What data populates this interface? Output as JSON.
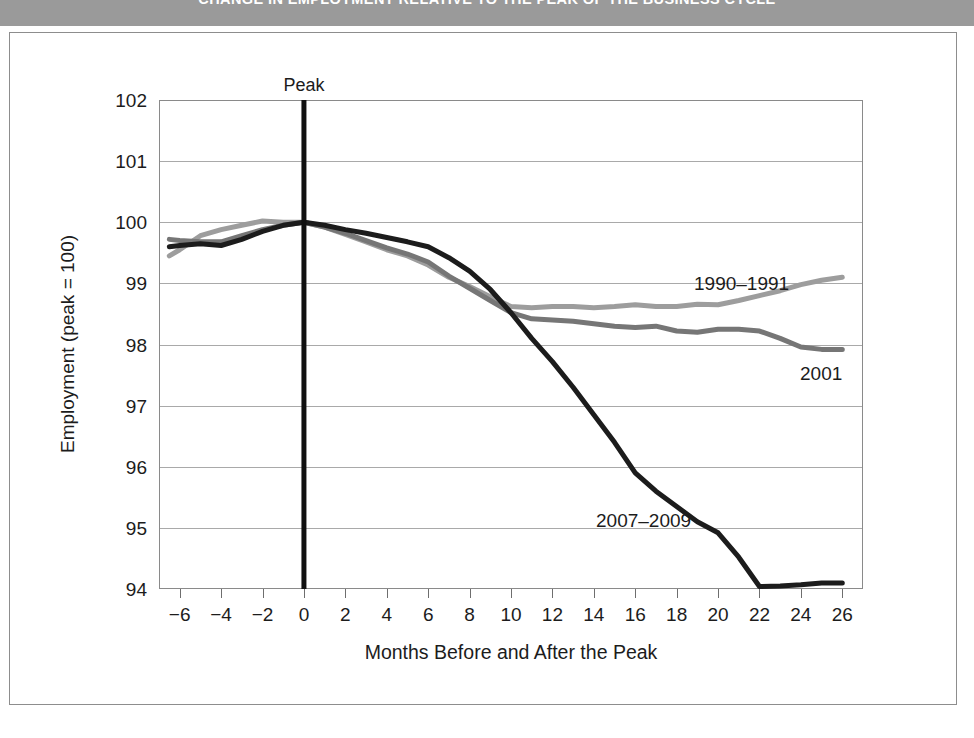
{
  "header": {
    "title": "CHANGE IN EMPLOYMENT RELATIVE TO THE PEAK OF THE BUSINESS CYCLE",
    "band_color": "#9a9a9a"
  },
  "annotations": {
    "peak_label": "Peak"
  },
  "chart_data": {
    "type": "line",
    "title": "",
    "xlabel": "Months Before and After the Peak",
    "ylabel": "Employment (peak = 100)",
    "xlim": [
      -7,
      27
    ],
    "ylim": [
      94,
      102
    ],
    "xticks": [
      "−6",
      "−4",
      "−2",
      "0",
      "2",
      "4",
      "6",
      "8",
      "10",
      "12",
      "14",
      "16",
      "18",
      "20",
      "22",
      "24",
      "26"
    ],
    "xtick_values": [
      -6,
      -4,
      -2,
      0,
      2,
      4,
      6,
      8,
      10,
      12,
      14,
      16,
      18,
      20,
      22,
      24,
      26
    ],
    "yticks": [
      "94",
      "95",
      "96",
      "97",
      "98",
      "99",
      "100",
      "101",
      "102"
    ],
    "ytick_values": [
      94,
      95,
      96,
      97,
      98,
      99,
      100,
      101,
      102
    ],
    "grid": "horizontal",
    "legend": "inline-labels",
    "vertical_reference_line": {
      "x": 0,
      "label": "Peak",
      "color": "#111111"
    },
    "x": [
      -6.5,
      -6,
      -5,
      -4,
      -3,
      -2,
      -1,
      0,
      1,
      2,
      3,
      4,
      5,
      6,
      7,
      8,
      9,
      10,
      11,
      12,
      13,
      14,
      15,
      16,
      17,
      18,
      19,
      20,
      21,
      22,
      23,
      24,
      25,
      26
    ],
    "series": [
      {
        "name": "1990–1991",
        "color": "#9d9d9d",
        "values": [
          99.45,
          99.55,
          99.78,
          99.88,
          99.95,
          100.02,
          100.0,
          100.0,
          99.92,
          99.8,
          99.68,
          99.55,
          99.45,
          99.3,
          99.1,
          98.95,
          98.78,
          98.62,
          98.6,
          98.62,
          98.62,
          98.6,
          98.62,
          98.65,
          98.62,
          98.62,
          98.66,
          98.65,
          98.72,
          98.8,
          98.88,
          98.98,
          99.05,
          99.1
        ]
      },
      {
        "name": "2001",
        "color": "#767676",
        "values": [
          99.72,
          99.7,
          99.68,
          99.68,
          99.78,
          99.88,
          99.95,
          100.0,
          99.92,
          99.82,
          99.7,
          99.58,
          99.48,
          99.35,
          99.12,
          98.92,
          98.72,
          98.52,
          98.42,
          98.4,
          98.38,
          98.34,
          98.3,
          98.28,
          98.3,
          98.22,
          98.2,
          98.25,
          98.25,
          98.22,
          98.1,
          97.96,
          97.92,
          97.92
        ]
      },
      {
        "name": "2007–2009",
        "color": "#1c1c1c",
        "values": [
          99.6,
          99.62,
          99.65,
          99.62,
          99.72,
          99.85,
          99.95,
          100.0,
          99.95,
          99.88,
          99.82,
          99.75,
          99.68,
          99.6,
          99.42,
          99.2,
          98.9,
          98.52,
          98.1,
          97.72,
          97.3,
          96.85,
          96.4,
          95.9,
          95.6,
          95.35,
          95.1,
          94.92,
          94.52,
          94.04,
          94.05,
          94.07,
          94.1,
          94.1
        ]
      }
    ]
  }
}
